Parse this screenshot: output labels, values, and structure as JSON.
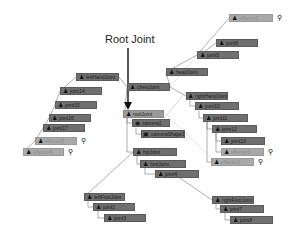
{
  "annotation": {
    "label": "Root Joint"
  },
  "icons": {
    "joint": "joint-icon",
    "ik": "ik-handle-icon",
    "camera": "camera-icon",
    "shape": "shape-icon"
  },
  "nodes": [
    {
      "id": "effectorTop",
      "label": "effector1",
      "x": 229,
      "y": 14,
      "w": 44,
      "light": true,
      "ik": true
    },
    {
      "id": "jointHead2",
      "label": "joint6",
      "x": 216,
      "y": 39,
      "w": 42
    },
    {
      "id": "jointHead1",
      "label": "joint5",
      "x": 197,
      "y": 51,
      "w": 42
    },
    {
      "id": "neck",
      "label": "headJoint",
      "x": 166,
      "y": 68,
      "w": 42
    },
    {
      "id": "chest",
      "label": "chestJoint",
      "x": 127,
      "y": 83,
      "w": 43
    },
    {
      "id": "rShoulder",
      "label": "rightHandJoint",
      "x": 186,
      "y": 92,
      "w": 42
    },
    {
      "id": "j10",
      "label": "joint10",
      "x": 195,
      "y": 102,
      "w": 44
    },
    {
      "id": "j11",
      "label": "joint11",
      "x": 203,
      "y": 114,
      "w": 45
    },
    {
      "id": "j12",
      "label": "joint12",
      "x": 212,
      "y": 125,
      "w": 45
    },
    {
      "id": "j13",
      "label": "joint13",
      "x": 221,
      "y": 137,
      "w": 44
    },
    {
      "id": "effR1",
      "label": "effector3",
      "x": 221,
      "y": 148,
      "w": 43,
      "light": true,
      "ik": true
    },
    {
      "id": "effR2",
      "label": "effector2",
      "x": 211,
      "y": 158,
      "w": 43,
      "light": true,
      "ik": true
    },
    {
      "id": "lShoulder",
      "label": "leftHandJoint",
      "x": 76,
      "y": 73,
      "w": 43
    },
    {
      "id": "j14",
      "label": "joint14",
      "x": 60,
      "y": 87,
      "w": 42
    },
    {
      "id": "j15",
      "label": "joint15",
      "x": 55,
      "y": 101,
      "w": 42
    },
    {
      "id": "j16",
      "label": "joint16",
      "x": 49,
      "y": 114,
      "w": 42
    },
    {
      "id": "j17",
      "label": "joint17",
      "x": 43,
      "y": 124,
      "w": 42
    },
    {
      "id": "effL1",
      "label": "effector5",
      "x": 35,
      "y": 137,
      "w": 42,
      "light": true,
      "ik": true
    },
    {
      "id": "effL2",
      "label": "effector4",
      "x": 23,
      "y": 148,
      "w": 41,
      "light": true,
      "ik": true
    },
    {
      "id": "root",
      "label": "rootJoint",
      "x": 123,
      "y": 110,
      "w": 41,
      "root": true
    },
    {
      "id": "camera",
      "label": "camera1",
      "x": 132,
      "y": 119,
      "w": 38,
      "icon": "camera"
    },
    {
      "id": "cameraShape",
      "label": "cameraShape1",
      "x": 141,
      "y": 130,
      "w": 44,
      "icon": "shape"
    },
    {
      "id": "hip",
      "label": "hipJoint",
      "x": 133,
      "y": 148,
      "w": 44
    },
    {
      "id": "footL",
      "label": "footJoint",
      "x": 140,
      "y": 160,
      "w": 46
    },
    {
      "id": "jFoot",
      "label": "joint4",
      "x": 155,
      "y": 170,
      "w": 44
    },
    {
      "id": "lLeg",
      "label": "leftFootJoint",
      "x": 84,
      "y": 193,
      "w": 41
    },
    {
      "id": "j2",
      "label": "joint2",
      "x": 93,
      "y": 203,
      "w": 42
    },
    {
      "id": "j3",
      "label": "joint3",
      "x": 104,
      "y": 214,
      "w": 42
    },
    {
      "id": "rLeg",
      "label": "rightFootJoint",
      "x": 212,
      "y": 196,
      "w": 42
    },
    {
      "id": "j7",
      "label": "joint7",
      "x": 220,
      "y": 205,
      "w": 44
    },
    {
      "id": "j8",
      "label": "joint8",
      "x": 230,
      "y": 216,
      "w": 43
    }
  ]
}
